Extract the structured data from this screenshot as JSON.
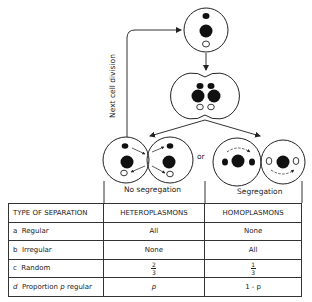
{
  "diagram": {
    "loop_label": "Next cell division",
    "or_label": "or",
    "left_outcome": "No segregation",
    "right_outcome": "Segregation"
  },
  "table": {
    "headers": [
      "TYPE OF SEPARATION",
      "HETEROPLASMONS",
      "HOMOPLASMONS"
    ],
    "rows": [
      {
        "letter": "a",
        "type": "Regular",
        "hetero": "All",
        "homo": "None"
      },
      {
        "letter": "b",
        "type": "Irregular",
        "hetero": "None",
        "homo": "All"
      },
      {
        "letter": "c",
        "type": "Random",
        "hetero_num": "2",
        "hetero_den": "3",
        "homo_num": "1",
        "homo_den": "3"
      },
      {
        "letter": "d",
        "type_pre": "Proportion",
        "type_var": "p",
        "type_post": "regular",
        "hetero": "p",
        "homo": "1 - p"
      }
    ]
  }
}
